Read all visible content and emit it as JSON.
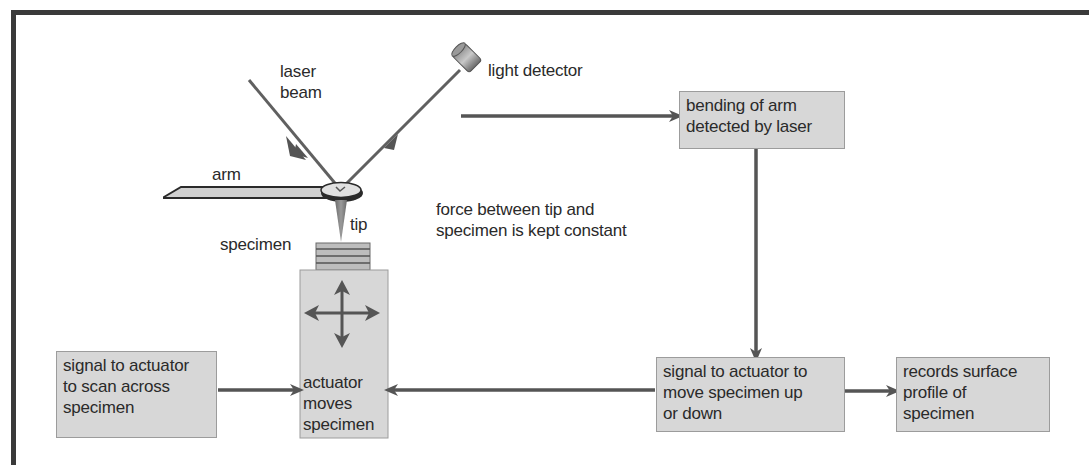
{
  "diagram": {
    "labels": {
      "laser_beam": [
        "laser",
        "beam"
      ],
      "light_detector": "light detector",
      "arm": "arm",
      "tip": "tip",
      "specimen": "specimen",
      "force_note": [
        "force between tip and",
        "specimen is kept constant"
      ]
    },
    "boxes": {
      "bending": [
        "bending of arm",
        "detected by laser"
      ],
      "scan_signal": [
        "signal to actuator",
        "to scan across",
        "specimen"
      ],
      "actuator": [
        "actuator",
        "moves",
        "specimen"
      ],
      "updown_signal": [
        "signal to actuator to",
        "move specimen up",
        "or down"
      ],
      "records": [
        "records surface",
        "profile of",
        "specimen"
      ]
    },
    "connections": [
      {
        "from": "light_detector",
        "to": "bending"
      },
      {
        "from": "bending",
        "to": "updown_signal"
      },
      {
        "from": "updown_signal",
        "to": "actuator"
      },
      {
        "from": "updown_signal",
        "to": "records"
      },
      {
        "from": "scan_signal",
        "to": "actuator"
      }
    ],
    "colors": {
      "frame": "#3a3a3a",
      "box_fill": "#d7d7d7",
      "box_border": "#9c9c9c",
      "arrow": "#555555",
      "text": "#2a2a2a"
    }
  }
}
